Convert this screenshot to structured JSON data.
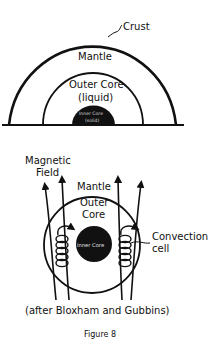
{
  "top_diagram": {
    "labels": {
      "crust": "Crust",
      "mantle": "Mantle",
      "outer_core_line1": "Outer Core",
      "outer_core_line2": "(liquid)",
      "inner_core_line1": "Inner Core",
      "inner_core_line2": "(solid)"
    }
  },
  "bottom_diagram": {
    "labels": {
      "magnetic_field_line1": "Magnetic",
      "magnetic_field_line2": "Field",
      "mantle": "Mantle",
      "outer_core_line1": "Outer",
      "outer_core_line2": "Core",
      "inner_core": "Inner Core",
      "convection_line1": "Convection",
      "convection_line2": "cell"
    },
    "credit": "(after Bloxham and Gubbins)"
  },
  "caption": "Figure 8",
  "colors": {
    "ink": "#111111",
    "background": "#ffffff"
  }
}
